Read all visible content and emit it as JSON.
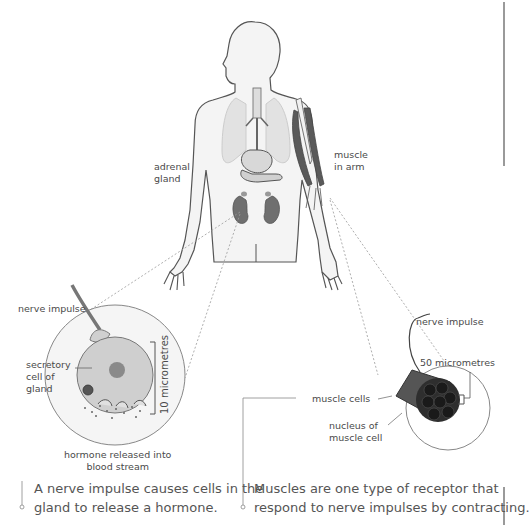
{
  "figure": {
    "labels": {
      "adrenal_gland": [
        "adrenal",
        "gland"
      ],
      "muscle_in_arm": [
        "muscle",
        "in arm"
      ],
      "gland_nerve_impulse": "nerve impulse",
      "secretory_cell": [
        "secretory",
        "cell of",
        "gland"
      ],
      "gland_scale": "10 micrometres",
      "hormone_released": [
        "hormone released into",
        "blood stream"
      ],
      "muscle_nerve_impulse": "nerve impulse",
      "muscle_scale": "50 micrometres",
      "muscle_cells": "muscle cells",
      "nucleus": [
        "nucleus of",
        "muscle cell"
      ]
    },
    "captions": {
      "gland": [
        "A nerve impulse causes cells in the",
        "gland to release a hormone."
      ],
      "muscle": [
        "Muscles are one type of receptor that",
        "respond to nerve impulses by contracting."
      ]
    },
    "colors": {
      "outline": "#555555",
      "body_fill": "#f3f3f3",
      "organ_dark": "#6f6f6f",
      "lung": "#e2e2e2",
      "cell_fill": "#cfcfcf",
      "muscle_dark": "#444444",
      "dashed": "#9a9a9a"
    }
  }
}
